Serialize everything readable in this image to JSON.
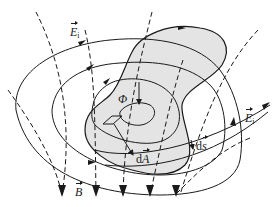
{
  "diagram": {
    "type": "physics-field-diagram",
    "colors": {
      "surface_fill": "#e4e4e4",
      "stroke": "#1a1a1a",
      "background": "#ffffff"
    },
    "labels": {
      "induced_field_top": {
        "symbol": "E",
        "subscript": "i"
      },
      "induced_field_right": {
        "symbol": "E",
        "subscript": "i"
      },
      "magnetic_field": {
        "symbol": "B"
      },
      "flux": {
        "symbol": "Φ"
      },
      "area_element": {
        "prefix": "d",
        "symbol": "A"
      },
      "line_element": {
        "prefix": "d",
        "symbol": "s"
      }
    },
    "elements": [
      "shaded surface bounded by closed curve with arrow",
      "dashed magnetic field lines B pointing downward",
      "closed induced electric field loops E_i with arrows",
      "flux arrow Φ pointing down",
      "small parallelogram area element dA with normal vector",
      "line element ds on boundary"
    ]
  }
}
